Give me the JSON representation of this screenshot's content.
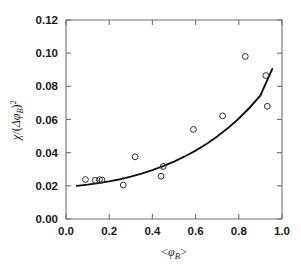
{
  "chart_data": {
    "type": "scatter",
    "title": "",
    "subtitle": "",
    "xlabel": "<φ_B>",
    "ylabel": "χ/(Δφ_B)²",
    "xlim": [
      0.0,
      1.0
    ],
    "ylim": [
      0.0,
      0.12
    ],
    "xticks": [
      0.0,
      0.2,
      0.4,
      0.6,
      0.8,
      1.0
    ],
    "yticks": [
      0.0,
      0.02,
      0.04,
      0.06,
      0.08,
      0.1,
      0.12
    ],
    "xtick_labels": [
      "0.0",
      "0.2",
      "0.4",
      "0.6",
      "0.8",
      "1.0"
    ],
    "ytick_labels": [
      "0.00",
      "0.02",
      "0.04",
      "0.06",
      "0.08",
      "0.10",
      "0.12"
    ],
    "grid": false,
    "legend": null,
    "marker": "open-circle",
    "marker_color": "#2b2b2b",
    "curve_color": "#111111",
    "series": [
      {
        "name": "data",
        "type": "scatter",
        "x": [
          0.09,
          0.135,
          0.155,
          0.167,
          0.265,
          0.32,
          0.44,
          0.45,
          0.59,
          0.725,
          0.83,
          0.925,
          0.932
        ],
        "y": [
          0.0238,
          0.0233,
          0.0237,
          0.0235,
          0.0205,
          0.0375,
          0.0258,
          0.0317,
          0.054,
          0.0622,
          0.098,
          0.0865,
          0.068
        ]
      },
      {
        "name": "fit",
        "type": "line",
        "x": [
          0.05,
          0.1,
          0.15,
          0.2,
          0.25,
          0.3,
          0.35,
          0.4,
          0.45,
          0.5,
          0.55,
          0.6,
          0.65,
          0.7,
          0.75,
          0.8,
          0.85,
          0.9,
          0.955
        ],
        "y": [
          0.02,
          0.0207,
          0.0216,
          0.0227,
          0.024,
          0.0256,
          0.0274,
          0.0295,
          0.0319,
          0.0346,
          0.0377,
          0.0412,
          0.0452,
          0.0497,
          0.0548,
          0.0606,
          0.0671,
          0.0745,
          0.0905
        ]
      }
    ],
    "axis_title_parts": {
      "y_chi": "χ",
      "y_slash": "/(",
      "y_delta_phi": "Δφ",
      "y_sub_B": "B",
      "y_close": ")",
      "y_sup_2": "2",
      "x_open": "<",
      "x_phi": "φ",
      "x_sub_B": "B",
      "x_close": ">"
    }
  }
}
